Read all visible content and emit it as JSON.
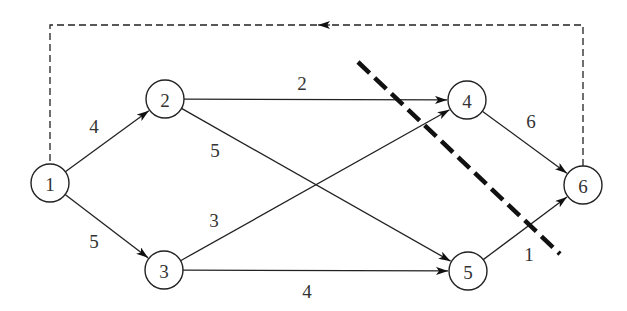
{
  "diagram": {
    "type": "directed network flow graph with cut",
    "nodes": [
      {
        "id": "1",
        "label": "1",
        "x": 50,
        "y": 183
      },
      {
        "id": "2",
        "label": "2",
        "x": 165,
        "y": 99
      },
      {
        "id": "3",
        "label": "3",
        "x": 164,
        "y": 270
      },
      {
        "id": "4",
        "label": "4",
        "x": 467,
        "y": 100
      },
      {
        "id": "5",
        "label": "5",
        "x": 468,
        "y": 271
      },
      {
        "id": "6",
        "label": "6",
        "x": 583,
        "y": 185
      }
    ],
    "edges": [
      {
        "from": "1",
        "to": "2",
        "label": "4",
        "lx": 94,
        "ly": 133
      },
      {
        "from": "1",
        "to": "3",
        "label": "5",
        "lx": 94,
        "ly": 248
      },
      {
        "from": "2",
        "to": "4",
        "label": "2",
        "lx": 302,
        "ly": 90
      },
      {
        "from": "2",
        "to": "5",
        "label": "5",
        "lx": 215,
        "ly": 157
      },
      {
        "from": "3",
        "to": "4",
        "label": "3",
        "lx": 214,
        "ly": 227
      },
      {
        "from": "3",
        "to": "5",
        "label": "4",
        "lx": 307,
        "ly": 298
      },
      {
        "from": "4",
        "to": "6",
        "label": "6",
        "lx": 531,
        "ly": 128
      },
      {
        "from": "5",
        "to": "6",
        "label": "1",
        "lx": 529,
        "ly": 261
      }
    ],
    "feedback_edge": {
      "from": "6",
      "to": "1",
      "style": "dashed"
    },
    "cut": {
      "x1": 358,
      "y1": 62,
      "x2": 560,
      "y2": 254,
      "style": "heavy-dashed"
    }
  }
}
